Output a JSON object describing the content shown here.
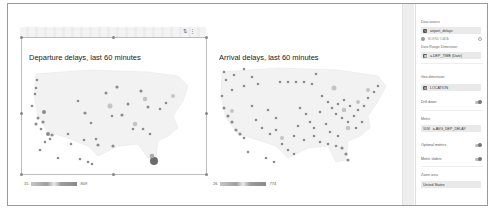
{
  "canvas": {
    "toolbar_icons": [
      "sort-icon",
      "more-vert-icon"
    ],
    "charts": [
      {
        "title": "Departure delays, last 60 minutes",
        "legend": {
          "min": "15",
          "max": "809"
        }
      },
      {
        "title": "Arrival delays, last 60 minutes",
        "legend": {
          "min": "26",
          "max": "774"
        }
      }
    ]
  },
  "panel": {
    "data_source": {
      "label": "Data source",
      "value": "airport_delays",
      "blend": "BLEND DATA"
    },
    "date_range": {
      "label": "Date Range Dimension",
      "value": "a.DEP_TIME (Date)"
    },
    "geo": {
      "label": "Geo dimension",
      "value": "LOCATION"
    },
    "drill_down": {
      "label": "Drill down"
    },
    "metric": {
      "label": "Metric",
      "prefix": "SUM",
      "value": "a.AVG_DEP_DELAY"
    },
    "optional_metrics": {
      "label": "Optional metrics"
    },
    "metric_sliders": {
      "label": "Metric sliders"
    },
    "zoom_area": {
      "label": "Zoom area",
      "value": "United States"
    }
  },
  "colors": {
    "frame": "#9a9a9a",
    "panel_chip": "#e9e9e9",
    "map_land": "#f2f2f2",
    "dot": "#8c8c8c"
  }
}
